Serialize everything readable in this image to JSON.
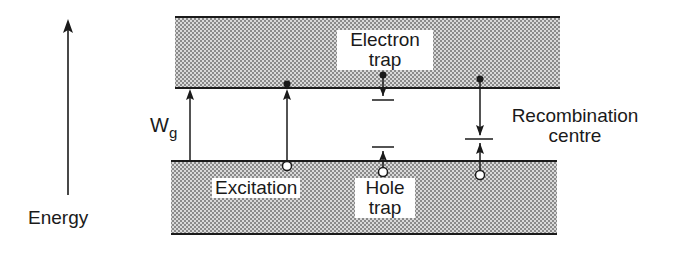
{
  "diagram": {
    "type": "energy-band-diagram",
    "axis": {
      "label": "Energy",
      "direction": "up"
    },
    "bandgap": {
      "label_main": "W",
      "label_sub": "g"
    },
    "bands": [
      {
        "name": "conduction-band",
        "fill": "stippled-grey"
      },
      {
        "name": "valence-band",
        "fill": "stippled-grey"
      }
    ],
    "processes": [
      {
        "name": "Excitation",
        "label": "Excitation",
        "description": "electron promoted from valence band (leaving hole) to conduction band"
      },
      {
        "name": "Electron trap",
        "label_line1": "Electron",
        "label_line2": "trap",
        "description": "conduction electron drops to trap level just below conduction band"
      },
      {
        "name": "Hole trap",
        "label_line1": "Hole",
        "label_line2": "trap",
        "description": "hole rises to trap level just above valence band"
      },
      {
        "name": "Recombination centre",
        "label_line1": "Recombination",
        "label_line2": "centre",
        "description": "electron and hole both move to a mid-gap level and recombine"
      }
    ],
    "legend": {
      "filled_dot": "electron",
      "open_circle": "hole"
    },
    "colors": {
      "ink": "#1a1a1a",
      "band_fill": "#bdbdbd",
      "background": "#ffffff"
    }
  }
}
